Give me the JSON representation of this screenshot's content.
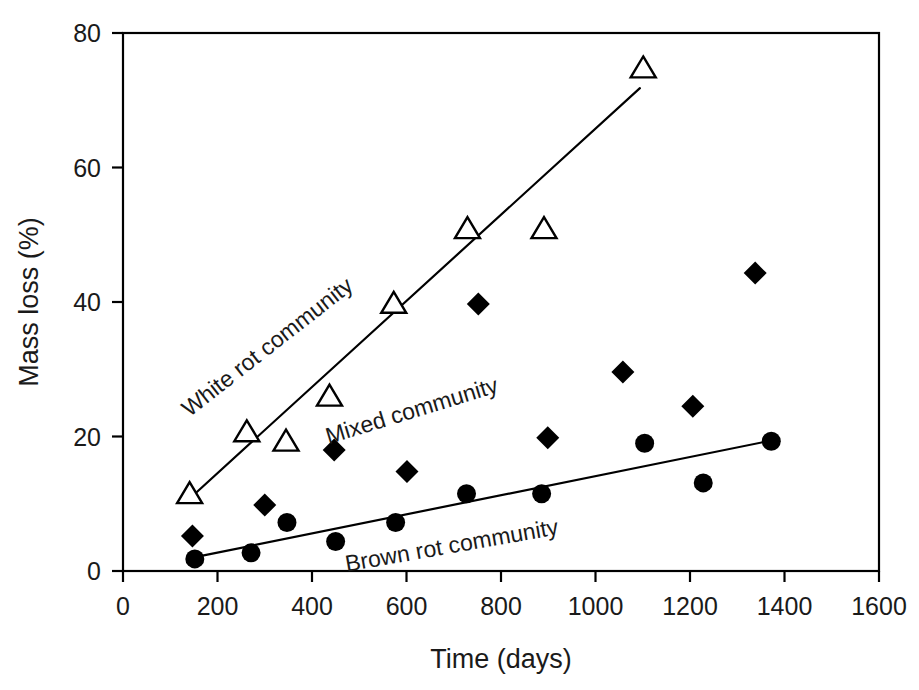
{
  "chart_data": {
    "type": "scatter",
    "title": "",
    "xlabel": "Time (days)",
    "ylabel": "Mass loss (%)",
    "xlim": [
      0,
      1600
    ],
    "ylim": [
      0,
      80
    ],
    "xticks": [
      0,
      200,
      400,
      600,
      800,
      1000,
      1200,
      1400,
      1600
    ],
    "xtick_labels": [
      "0",
      "200",
      "400",
      "600",
      "800",
      "1000",
      "1200",
      "1400",
      "1600"
    ],
    "yticks": [
      0,
      20,
      40,
      60,
      80
    ],
    "ytick_labels": [
      "0",
      "20",
      "40",
      "60",
      "80"
    ],
    "grid": false,
    "legend_position": "inline-annotations",
    "series": [
      {
        "name": "White rot community",
        "marker": "open-triangle",
        "color": "#000000",
        "points": [
          {
            "x": 141,
            "y": 11.5
          },
          {
            "x": 262,
            "y": 20.7
          },
          {
            "x": 345,
            "y": 19.3
          },
          {
            "x": 437,
            "y": 26.0
          },
          {
            "x": 573,
            "y": 39.8
          },
          {
            "x": 729,
            "y": 50.9
          },
          {
            "x": 891,
            "y": 50.9
          },
          {
            "x": 1101,
            "y": 74.8
          }
        ],
        "trend_line": {
          "x1": 143,
          "y1": 10.9,
          "x2": 1094,
          "y2": 71.8
        }
      },
      {
        "name": "Mixed community",
        "marker": "filled-diamond",
        "color": "#000000",
        "points": [
          {
            "x": 147,
            "y": 5.2
          },
          {
            "x": 300,
            "y": 9.8
          },
          {
            "x": 447,
            "y": 18.0
          },
          {
            "x": 601,
            "y": 14.8
          },
          {
            "x": 752,
            "y": 39.7
          },
          {
            "x": 899,
            "y": 19.8
          },
          {
            "x": 1058,
            "y": 29.6
          },
          {
            "x": 1206,
            "y": 24.5
          },
          {
            "x": 1338,
            "y": 44.3
          }
        ],
        "trend_line": null
      },
      {
        "name": "Brown rot community",
        "marker": "filled-circle",
        "color": "#000000",
        "points": [
          {
            "x": 152,
            "y": 1.8
          },
          {
            "x": 271,
            "y": 2.7
          },
          {
            "x": 347,
            "y": 7.2
          },
          {
            "x": 450,
            "y": 4.4
          },
          {
            "x": 577,
            "y": 7.2
          },
          {
            "x": 727,
            "y": 11.5
          },
          {
            "x": 886,
            "y": 11.5
          },
          {
            "x": 1104,
            "y": 19.0
          },
          {
            "x": 1228,
            "y": 13.1
          },
          {
            "x": 1372,
            "y": 19.3
          }
        ],
        "trend_line": {
          "x1": 155,
          "y1": 2.1,
          "x2": 1379,
          "y2": 19.5
        }
      }
    ],
    "annotations": [
      {
        "text": "White rot community",
        "x_px": 272,
        "y_px": 353,
        "rotation_deg": -38
      },
      {
        "text": "Mixed community",
        "x_px": 414,
        "y_px": 418,
        "rotation_deg": -17
      },
      {
        "text": "Brown rot community",
        "x_px": 453,
        "y_px": 553,
        "rotation_deg": -10
      }
    ]
  },
  "axes": {
    "x_axis_name": "Time (days)",
    "y_axis_name": "Mass loss (%)"
  }
}
